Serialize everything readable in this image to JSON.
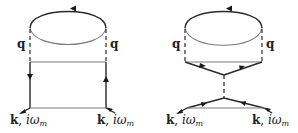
{
  "diagrams": [
    {
      "name": "left-diagram",
      "loop_label_left": "q",
      "loop_label_right": "q",
      "external_left": {
        "bold": "k",
        "sep": ", ",
        "ital": "iω",
        "sub": "m"
      },
      "external_right": {
        "bold": "k",
        "sep": ", ",
        "ital": "iω",
        "sub": "m"
      }
    },
    {
      "name": "right-diagram",
      "loop_label_left": "q",
      "loop_label_right": "q",
      "external_left": {
        "bold": "k",
        "sep": ", ",
        "ital": "iω",
        "sub": "m"
      },
      "external_right": {
        "bold": "k",
        "sep": ", ",
        "ital": "iω",
        "sub": "m"
      }
    }
  ],
  "colors": {
    "line": "#2a2a2a",
    "thin": "#7a7a7a",
    "background": "#ffffff"
  }
}
